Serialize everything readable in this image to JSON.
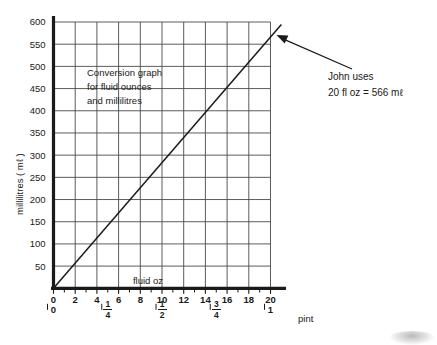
{
  "chart_data": {
    "type": "line",
    "title": "Conversion graph for fluid ounces and millilitres",
    "note_lines": [
      "Conversion graph",
      "for fluid ounces",
      "and millilitres"
    ],
    "xlabel": "fluid  oz",
    "ylabel": "millilitres ( mℓ )",
    "xlim": [
      0,
      20
    ],
    "ylim": [
      0,
      600
    ],
    "grid": true,
    "legend": "none",
    "x_ticks": [
      "0",
      "2",
      "4",
      "6",
      "8",
      "10",
      "12",
      "14",
      "16",
      "18",
      "20"
    ],
    "x_tick_values": [
      0,
      2,
      4,
      6,
      8,
      10,
      12,
      14,
      16,
      18,
      20
    ],
    "x_minor_tick_values": [
      1,
      3,
      5,
      7,
      9,
      11,
      13,
      15,
      17,
      19
    ],
    "y_ticks": [
      "50",
      "100",
      "150",
      "200",
      "250",
      "300",
      "350",
      "400",
      "450",
      "500",
      "550",
      "600"
    ],
    "y_tick_values": [
      50,
      100,
      150,
      200,
      250,
      300,
      350,
      400,
      450,
      500,
      550,
      600
    ],
    "secondary_axis": {
      "label": "pint",
      "ticks": [
        {
          "value": 0,
          "display": "0",
          "type": "whole"
        },
        {
          "value": 5,
          "display": "1/4",
          "type": "fraction",
          "num": "1",
          "den": "4"
        },
        {
          "value": 10,
          "display": "1/2",
          "type": "fraction",
          "num": "1",
          "den": "2"
        },
        {
          "value": 15,
          "display": "3/4",
          "type": "fraction",
          "num": "3",
          "den": "4"
        },
        {
          "value": 20,
          "display": "1",
          "type": "whole",
          "suffix": "pint"
        }
      ]
    },
    "series": [
      {
        "name": "fluid ounces to millilitres",
        "x": [
          0,
          20
        ],
        "y": [
          0,
          566
        ],
        "points": [
          [
            0,
            0
          ],
          [
            20,
            566
          ]
        ],
        "slope_ml_per_floz": 28.3
      }
    ],
    "annotations": [
      {
        "name": "john-uses",
        "lines": [
          "John uses",
          "20 fl oz = 566 mℓ"
        ],
        "arrow_from": [
          20.95,
          590
        ],
        "arrow_to": [
          20.0,
          566
        ]
      }
    ]
  },
  "labels": {
    "x_axis_caption": "fluid  oz",
    "y_axis_caption": "millilitres ( mℓ )",
    "pint_unit": "pint",
    "pint_zero": "0",
    "pint_one": "1"
  },
  "annotation": {
    "line1": "John uses",
    "line2": "20 fl oz = 566 mℓ"
  },
  "note": {
    "line1": "Conversion graph",
    "line2": "for fluid ounces",
    "line3": "and millilitres"
  },
  "colors": {
    "ink": "#1a1a1a",
    "grid": "#4a4a4a",
    "background": "#ffffff"
  }
}
